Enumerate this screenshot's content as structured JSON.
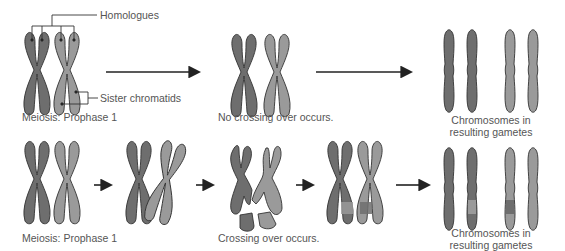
{
  "colors": {
    "dark_chromosome": "#6e6e6e",
    "light_chromosome": "#9a9a9a",
    "outline": "#333333",
    "arrow": "#222222",
    "text": "#555555"
  },
  "top_row": {
    "callouts": {
      "homologues": "Homologues",
      "sister_chromatids": "Sister chromatids"
    },
    "stage_label": "Meiosis: Prophase 1",
    "middle_label": "No crossing over occurs.",
    "result_label_line1": "Chromosomes in",
    "result_label_line2": "resulting gametes"
  },
  "bottom_row": {
    "stage_label": "Meiosis: Prophase 1",
    "middle_label": "Crossing over occurs.",
    "result_label_line1": "Chromosomes in",
    "result_label_line2": "resulting gametes"
  }
}
